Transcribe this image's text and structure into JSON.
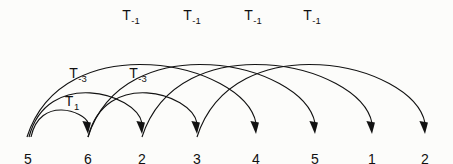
{
  "figure": {
    "type": "arc-diagram",
    "background_color": "#fcfcfa",
    "stroke_color": "#121212",
    "width": 453,
    "height": 164,
    "baseline_y": 137
  },
  "nodes": [
    {
      "id": "n0",
      "label": "5",
      "x": 28,
      "y": 152
    },
    {
      "id": "n1",
      "label": "6",
      "x": 88,
      "y": 152
    },
    {
      "id": "n2",
      "label": "2",
      "x": 142,
      "y": 152
    },
    {
      "id": "n3",
      "label": "3",
      "x": 197,
      "y": 152
    },
    {
      "id": "n4",
      "label": "4",
      "x": 256,
      "y": 152
    },
    {
      "id": "n5",
      "label": "5",
      "x": 315,
      "y": 152
    },
    {
      "id": "n6",
      "label": "1",
      "x": 372,
      "y": 152
    },
    {
      "id": "n7",
      "label": "2",
      "x": 425,
      "y": 152
    }
  ],
  "arcs": [
    {
      "id": "a0",
      "from_x": 31,
      "to_x": 88,
      "apex_y": 101,
      "label_ref": "l_t1"
    },
    {
      "id": "a1",
      "from_x": 29,
      "to_x": 142,
      "apex_y": 74,
      "label_ref": "l_t3a"
    },
    {
      "id": "a2",
      "from_x": 88,
      "to_x": 197,
      "apex_y": 74,
      "label_ref": "l_t3b"
    },
    {
      "id": "a3",
      "from_x": 27,
      "to_x": 256,
      "apex_y": 30,
      "label_ref": "l_ta"
    },
    {
      "id": "a4",
      "from_x": 88,
      "to_x": 315,
      "apex_y": 30,
      "label_ref": "l_tb"
    },
    {
      "id": "a5",
      "from_x": 142,
      "to_x": 372,
      "apex_y": 30,
      "label_ref": "l_tc"
    },
    {
      "id": "a6",
      "from_x": 197,
      "to_x": 425,
      "apex_y": 30,
      "label_ref": "l_td"
    }
  ],
  "arc_labels": [
    {
      "id": "l_t1",
      "base": "T",
      "subscript": "1",
      "text": "T1",
      "x": 72,
      "y": 94
    },
    {
      "id": "l_t3a",
      "base": "T",
      "subscript": "-3",
      "text": "T-3",
      "x": 78,
      "y": 66
    },
    {
      "id": "l_t3b",
      "base": "T",
      "subscript": "-3",
      "text": "T-3",
      "x": 138,
      "y": 66
    },
    {
      "id": "l_ta",
      "base": "T",
      "subscript": "-1",
      "text": "T-1",
      "x": 131,
      "y": 8
    },
    {
      "id": "l_tb",
      "base": "T",
      "subscript": "-1",
      "text": "T-1",
      "x": 192,
      "y": 8
    },
    {
      "id": "l_tc",
      "base": "T",
      "subscript": "-1",
      "text": "T-1",
      "x": 253,
      "y": 8
    },
    {
      "id": "l_td",
      "base": "T",
      "subscript": "-1",
      "text": "T-1",
      "x": 312,
      "y": 8
    }
  ]
}
